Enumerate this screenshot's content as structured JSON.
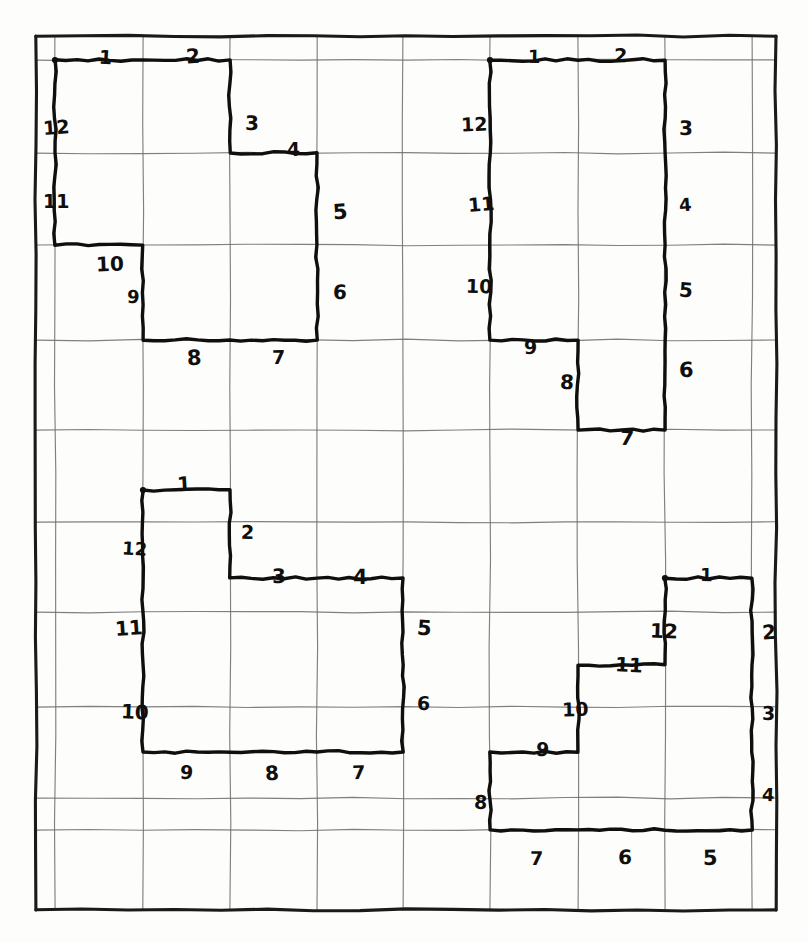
{
  "page": {
    "background_color": "#fdfdfb",
    "ink_color": "#100f0d",
    "grid_line_color": "#6e6e70",
    "border_color": "#1a1a18",
    "paper_tint": "#ffffff"
  },
  "grid": {
    "description": "hand-ruled grid with heavy outer border",
    "border": {
      "x0": 36,
      "y0": 36,
      "x1": 776,
      "y1": 910
    },
    "x_lines": [
      36,
      55,
      143,
      230,
      317,
      403,
      490,
      578,
      665,
      752,
      776
    ],
    "y_lines": [
      36,
      60,
      153,
      245,
      340,
      430,
      522,
      612,
      707,
      798,
      830,
      910
    ],
    "columns": 8,
    "rows": 9,
    "cell_width": 87,
    "cell_height": 92
  },
  "figures": [
    {
      "id": "figure-top-left",
      "name": "Figure 1",
      "start_dot": {
        "x": 55,
        "y": 60
      },
      "vertices": [
        [
          55,
          60
        ],
        [
          143,
          60
        ],
        [
          230,
          60
        ],
        [
          230,
          153
        ],
        [
          317,
          153
        ],
        [
          317,
          245
        ],
        [
          317,
          340
        ],
        [
          230,
          340
        ],
        [
          143,
          340
        ],
        [
          143,
          245
        ],
        [
          55,
          245
        ],
        [
          55,
          153
        ],
        [
          55,
          60
        ]
      ],
      "segments": [
        {
          "n": "1",
          "dir": "right",
          "lx": 99,
          "ly": 48
        },
        {
          "n": "2",
          "dir": "right",
          "lx": 186,
          "ly": 46
        },
        {
          "n": "3",
          "dir": "down",
          "lx": 245,
          "ly": 113
        },
        {
          "n": "4",
          "dir": "right",
          "lx": 287,
          "ly": 140
        },
        {
          "n": "5",
          "dir": "down",
          "lx": 333,
          "ly": 202
        },
        {
          "n": "6",
          "dir": "down",
          "lx": 333,
          "ly": 282
        },
        {
          "n": "7",
          "dir": "left",
          "lx": 272,
          "ly": 348
        },
        {
          "n": "8",
          "dir": "left",
          "lx": 187,
          "ly": 348
        },
        {
          "n": "9",
          "dir": "up",
          "lx": 127,
          "ly": 288
        },
        {
          "n": "10",
          "dir": "left",
          "lx": 96,
          "ly": 254
        },
        {
          "n": "11",
          "dir": "up",
          "lx": 43,
          "ly": 192
        },
        {
          "n": "12",
          "dir": "up",
          "lx": 43,
          "ly": 118
        }
      ]
    },
    {
      "id": "figure-top-right",
      "name": "Figure 2",
      "start_dot": {
        "x": 490,
        "y": 60
      },
      "vertices": [
        [
          490,
          60
        ],
        [
          578,
          60
        ],
        [
          665,
          60
        ],
        [
          665,
          153
        ],
        [
          665,
          245
        ],
        [
          665,
          340
        ],
        [
          665,
          430
        ],
        [
          578,
          430
        ],
        [
          578,
          340
        ],
        [
          490,
          340
        ],
        [
          490,
          245
        ],
        [
          490,
          153
        ],
        [
          490,
          60
        ]
      ],
      "segments": [
        {
          "n": "1",
          "dir": "right",
          "lx": 528,
          "ly": 48
        },
        {
          "n": "2",
          "dir": "right",
          "lx": 614,
          "ly": 46
        },
        {
          "n": "3",
          "dir": "down",
          "lx": 679,
          "ly": 118
        },
        {
          "n": "4",
          "dir": "down",
          "lx": 679,
          "ly": 196
        },
        {
          "n": "5",
          "dir": "down",
          "lx": 679,
          "ly": 280
        },
        {
          "n": "6",
          "dir": "down",
          "lx": 679,
          "ly": 360
        },
        {
          "n": "7",
          "dir": "left",
          "lx": 620,
          "ly": 428
        },
        {
          "n": "8",
          "dir": "up",
          "lx": 560,
          "ly": 372
        },
        {
          "n": "9",
          "dir": "left",
          "lx": 524,
          "ly": 338
        },
        {
          "n": "10",
          "dir": "up",
          "lx": 466,
          "ly": 277
        },
        {
          "n": "11",
          "dir": "up",
          "lx": 468,
          "ly": 195
        },
        {
          "n": "12",
          "dir": "up",
          "lx": 461,
          "ly": 115
        }
      ]
    },
    {
      "id": "figure-bottom-left",
      "name": "Figure 3",
      "start_dot": {
        "x": 143,
        "y": 490
      },
      "vertices": [
        [
          143,
          490
        ],
        [
          230,
          490
        ],
        [
          230,
          578
        ],
        [
          317,
          578
        ],
        [
          403,
          578
        ],
        [
          403,
          665
        ],
        [
          403,
          752
        ],
        [
          317,
          752
        ],
        [
          230,
          752
        ],
        [
          143,
          752
        ],
        [
          143,
          665
        ],
        [
          143,
          578
        ],
        [
          143,
          490
        ]
      ],
      "segments": [
        {
          "n": "1",
          "dir": "right",
          "lx": 177,
          "ly": 474
        },
        {
          "n": "2",
          "dir": "down",
          "lx": 241,
          "ly": 523
        },
        {
          "n": "3",
          "dir": "right",
          "lx": 272,
          "ly": 566
        },
        {
          "n": "4",
          "dir": "right",
          "lx": 353,
          "ly": 567
        },
        {
          "n": "5",
          "dir": "down",
          "lx": 417,
          "ly": 618
        },
        {
          "n": "6",
          "dir": "down",
          "lx": 417,
          "ly": 694
        },
        {
          "n": "7",
          "dir": "left",
          "lx": 352,
          "ly": 763
        },
        {
          "n": "8",
          "dir": "left",
          "lx": 265,
          "ly": 763
        },
        {
          "n": "9",
          "dir": "left",
          "lx": 180,
          "ly": 763
        },
        {
          "n": "10",
          "dir": "up",
          "lx": 121,
          "ly": 702
        },
        {
          "n": "11",
          "dir": "up",
          "lx": 115,
          "ly": 618
        },
        {
          "n": "12",
          "dir": "up",
          "lx": 122,
          "ly": 540
        }
      ]
    },
    {
      "id": "figure-bottom-right",
      "name": "Figure 4",
      "start_dot": {
        "x": 665,
        "y": 578
      },
      "vertices": [
        [
          665,
          578
        ],
        [
          752,
          578
        ],
        [
          752,
          665
        ],
        [
          752,
          752
        ],
        [
          752,
          830
        ],
        [
          665,
          830
        ],
        [
          578,
          830
        ],
        [
          490,
          830
        ],
        [
          490,
          752
        ],
        [
          578,
          752
        ],
        [
          578,
          665
        ],
        [
          665,
          665
        ],
        [
          665,
          578
        ]
      ],
      "segments": [
        {
          "n": "1",
          "dir": "right",
          "lx": 700,
          "ly": 566
        },
        {
          "n": "2",
          "dir": "down",
          "lx": 762,
          "ly": 622
        },
        {
          "n": "3",
          "dir": "down",
          "lx": 762,
          "ly": 704
        },
        {
          "n": "4",
          "dir": "down",
          "lx": 762,
          "ly": 786
        },
        {
          "n": "5",
          "dir": "left",
          "lx": 703,
          "ly": 848
        },
        {
          "n": "6",
          "dir": "left",
          "lx": 618,
          "ly": 847
        },
        {
          "n": "7",
          "dir": "left",
          "lx": 530,
          "ly": 849
        },
        {
          "n": "8",
          "dir": "up",
          "lx": 474,
          "ly": 793
        },
        {
          "n": "9",
          "dir": "right",
          "lx": 536,
          "ly": 740
        },
        {
          "n": "10",
          "dir": "up",
          "lx": 562,
          "ly": 700
        },
        {
          "n": "11",
          "dir": "right",
          "lx": 615,
          "ly": 655
        },
        {
          "n": "12",
          "dir": "up",
          "lx": 650,
          "ly": 621
        }
      ]
    }
  ]
}
